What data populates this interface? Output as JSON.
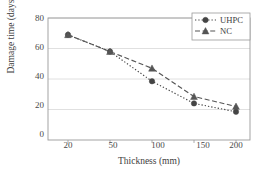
{
  "chart_data": {
    "type": "line",
    "title": "",
    "xlabel": "Thickness (mm)",
    "ylabel": "Damage time (days)",
    "categories": [
      20,
      50,
      100,
      150,
      200
    ],
    "xtick_labels": [
      "20",
      "50",
      "100",
      "150",
      "200"
    ],
    "ytick_labels": [
      "0",
      "20",
      "40",
      "60",
      "80"
    ],
    "yticks": [
      0,
      20,
      40,
      60,
      80
    ],
    "ylim": [
      0,
      80
    ],
    "grid": "horizontal",
    "legend_position": "top-right",
    "series": [
      {
        "name": "UHPC",
        "marker": "circle",
        "linestyle": "dotted",
        "color": "#444444",
        "values": [
          69,
          58,
          38.5,
          24,
          18.5
        ]
      },
      {
        "name": "NC",
        "marker": "triangle",
        "linestyle": "dashed",
        "color": "#555555",
        "values": [
          69,
          58,
          47,
          28.5,
          22
        ]
      }
    ]
  },
  "style": {
    "axis_color": "#9a9a9a",
    "grid_color": "#d8d8d8",
    "text_color": "#3d3d3d",
    "background": "#ffffff"
  },
  "legend": {
    "items": [
      {
        "label": "UHPC"
      },
      {
        "label": "NC"
      }
    ]
  }
}
